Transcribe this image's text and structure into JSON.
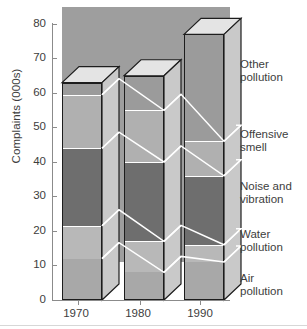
{
  "chart_data": {
    "type": "bar",
    "subtype": "stacked-3d-column",
    "title": "",
    "xlabel": "",
    "ylabel": "Complaints (000s)",
    "categories": [
      "1970",
      "1980",
      "1990"
    ],
    "ylim": [
      0,
      80
    ],
    "yticks": [
      0,
      10,
      20,
      30,
      40,
      50,
      60,
      70,
      80
    ],
    "ytick_labels": [
      "0",
      "10",
      "20",
      "30",
      "40",
      "50",
      "60",
      "70",
      "80"
    ],
    "grid": false,
    "legend_position": "right-outside",
    "stack_order_bottom_to_top": [
      "Air pollution",
      "Water pollution",
      "Noise and vibration",
      "Offensive smell",
      "Other pollution"
    ],
    "series": [
      {
        "name": "Air pollution",
        "values": [
          12.0,
          8.0,
          11.0
        ],
        "color": "#a8a8a8"
      },
      {
        "name": "Water pollution",
        "values": [
          9.5,
          9.0,
          5.0
        ],
        "color": "#b8b8b8"
      },
      {
        "name": "Noise and vibration",
        "values": [
          22.5,
          23.0,
          20.0
        ],
        "color": "#6e6e6e"
      },
      {
        "name": "Offensive smell",
        "values": [
          15.5,
          15.0,
          10.0
        ],
        "color": "#b0b0b0"
      },
      {
        "name": "Other pollution",
        "values": [
          3.5,
          10.0,
          31.0
        ],
        "color": "#9b9b9b"
      }
    ],
    "cumulative_tops": {
      "1970": [
        12.0,
        21.5,
        44.0,
        59.5,
        63.0
      ],
      "1980": [
        8.0,
        17.0,
        40.0,
        55.0,
        65.0
      ],
      "1990": [
        11.0,
        16.0,
        36.0,
        46.0,
        77.0
      ]
    },
    "totals": [
      63.0,
      65.0,
      77.0
    ],
    "annotations": [],
    "colors": {
      "plot_panel": "#9e9e9e",
      "page_background": "#ffffff",
      "axis": "#8b8b8b",
      "text": "#3d3d3d",
      "bar_outline": "#1d1d1d",
      "segment_divider": "#ffffff",
      "top_face": "#e4e4e4",
      "side_face": "#c9c9c9"
    }
  },
  "axis": {
    "y_title": "Complaints (000s)",
    "y_tick_labels": [
      "80",
      "70",
      "60",
      "50",
      "40",
      "30",
      "20",
      "10",
      "0"
    ],
    "x_tick_labels": [
      "1970",
      "1980",
      "1990"
    ]
  },
  "legend": {
    "items": [
      {
        "line1": "Other",
        "line2": "pollution"
      },
      {
        "line1": "Offensive",
        "line2": "smell"
      },
      {
        "line1": "Noise and",
        "line2": "vibration"
      },
      {
        "line1": "Water",
        "line2": "pollution"
      },
      {
        "line1": "Air",
        "line2": "pollution"
      }
    ]
  }
}
